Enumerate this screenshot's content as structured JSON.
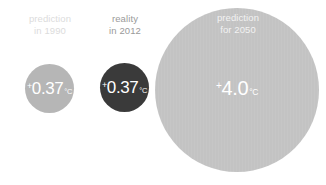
{
  "chart_data": {
    "type": "bar",
    "xlabel": "",
    "ylabel": "Temperature anomaly (°C)",
    "categories": [
      "prediction in 1990",
      "reality in 2012",
      "prediction for 2050"
    ],
    "values": [
      0.37,
      0.37,
      4.0
    ],
    "value_labels": [
      "+0.37°C",
      "+0.37°C",
      "+4.0°C"
    ],
    "unit": "°C",
    "encoding": "bubble-area",
    "grid": false,
    "legend": false,
    "bubble_diameters_px": [
      49,
      49,
      164
    ],
    "series": [
      {
        "name": "Temperature anomaly",
        "values": [
          0.37,
          0.37,
          4.0
        ]
      }
    ]
  },
  "bubbles": [
    {
      "id": "prediction-1990",
      "caption_line1": "prediction",
      "caption_line2": "in 1990",
      "sign": "+",
      "number": "0.37",
      "unit": "°C",
      "fill": "#b6b6b6",
      "caption_color": "#dcdcdc"
    },
    {
      "id": "reality-2012",
      "caption_line1": "reality",
      "caption_line2": "in 2012",
      "sign": "+",
      "number": "0.37",
      "unit": "°C",
      "fill": "#3a3a3a",
      "caption_color": "#9a9a9a"
    },
    {
      "id": "prediction-2050",
      "caption_line1": "prediction",
      "caption_line2": "for 2050",
      "sign": "+",
      "number": "4.0",
      "unit": "°C",
      "fill": "#c3c3c3",
      "caption_color": "#f2f2f2"
    }
  ],
  "colors": {
    "background": "#ffffff",
    "value_text": "#ffffff",
    "light_gray": "#b6b6b6",
    "dark_gray": "#3a3a3a",
    "pale_gray": "#c3c3c3"
  }
}
